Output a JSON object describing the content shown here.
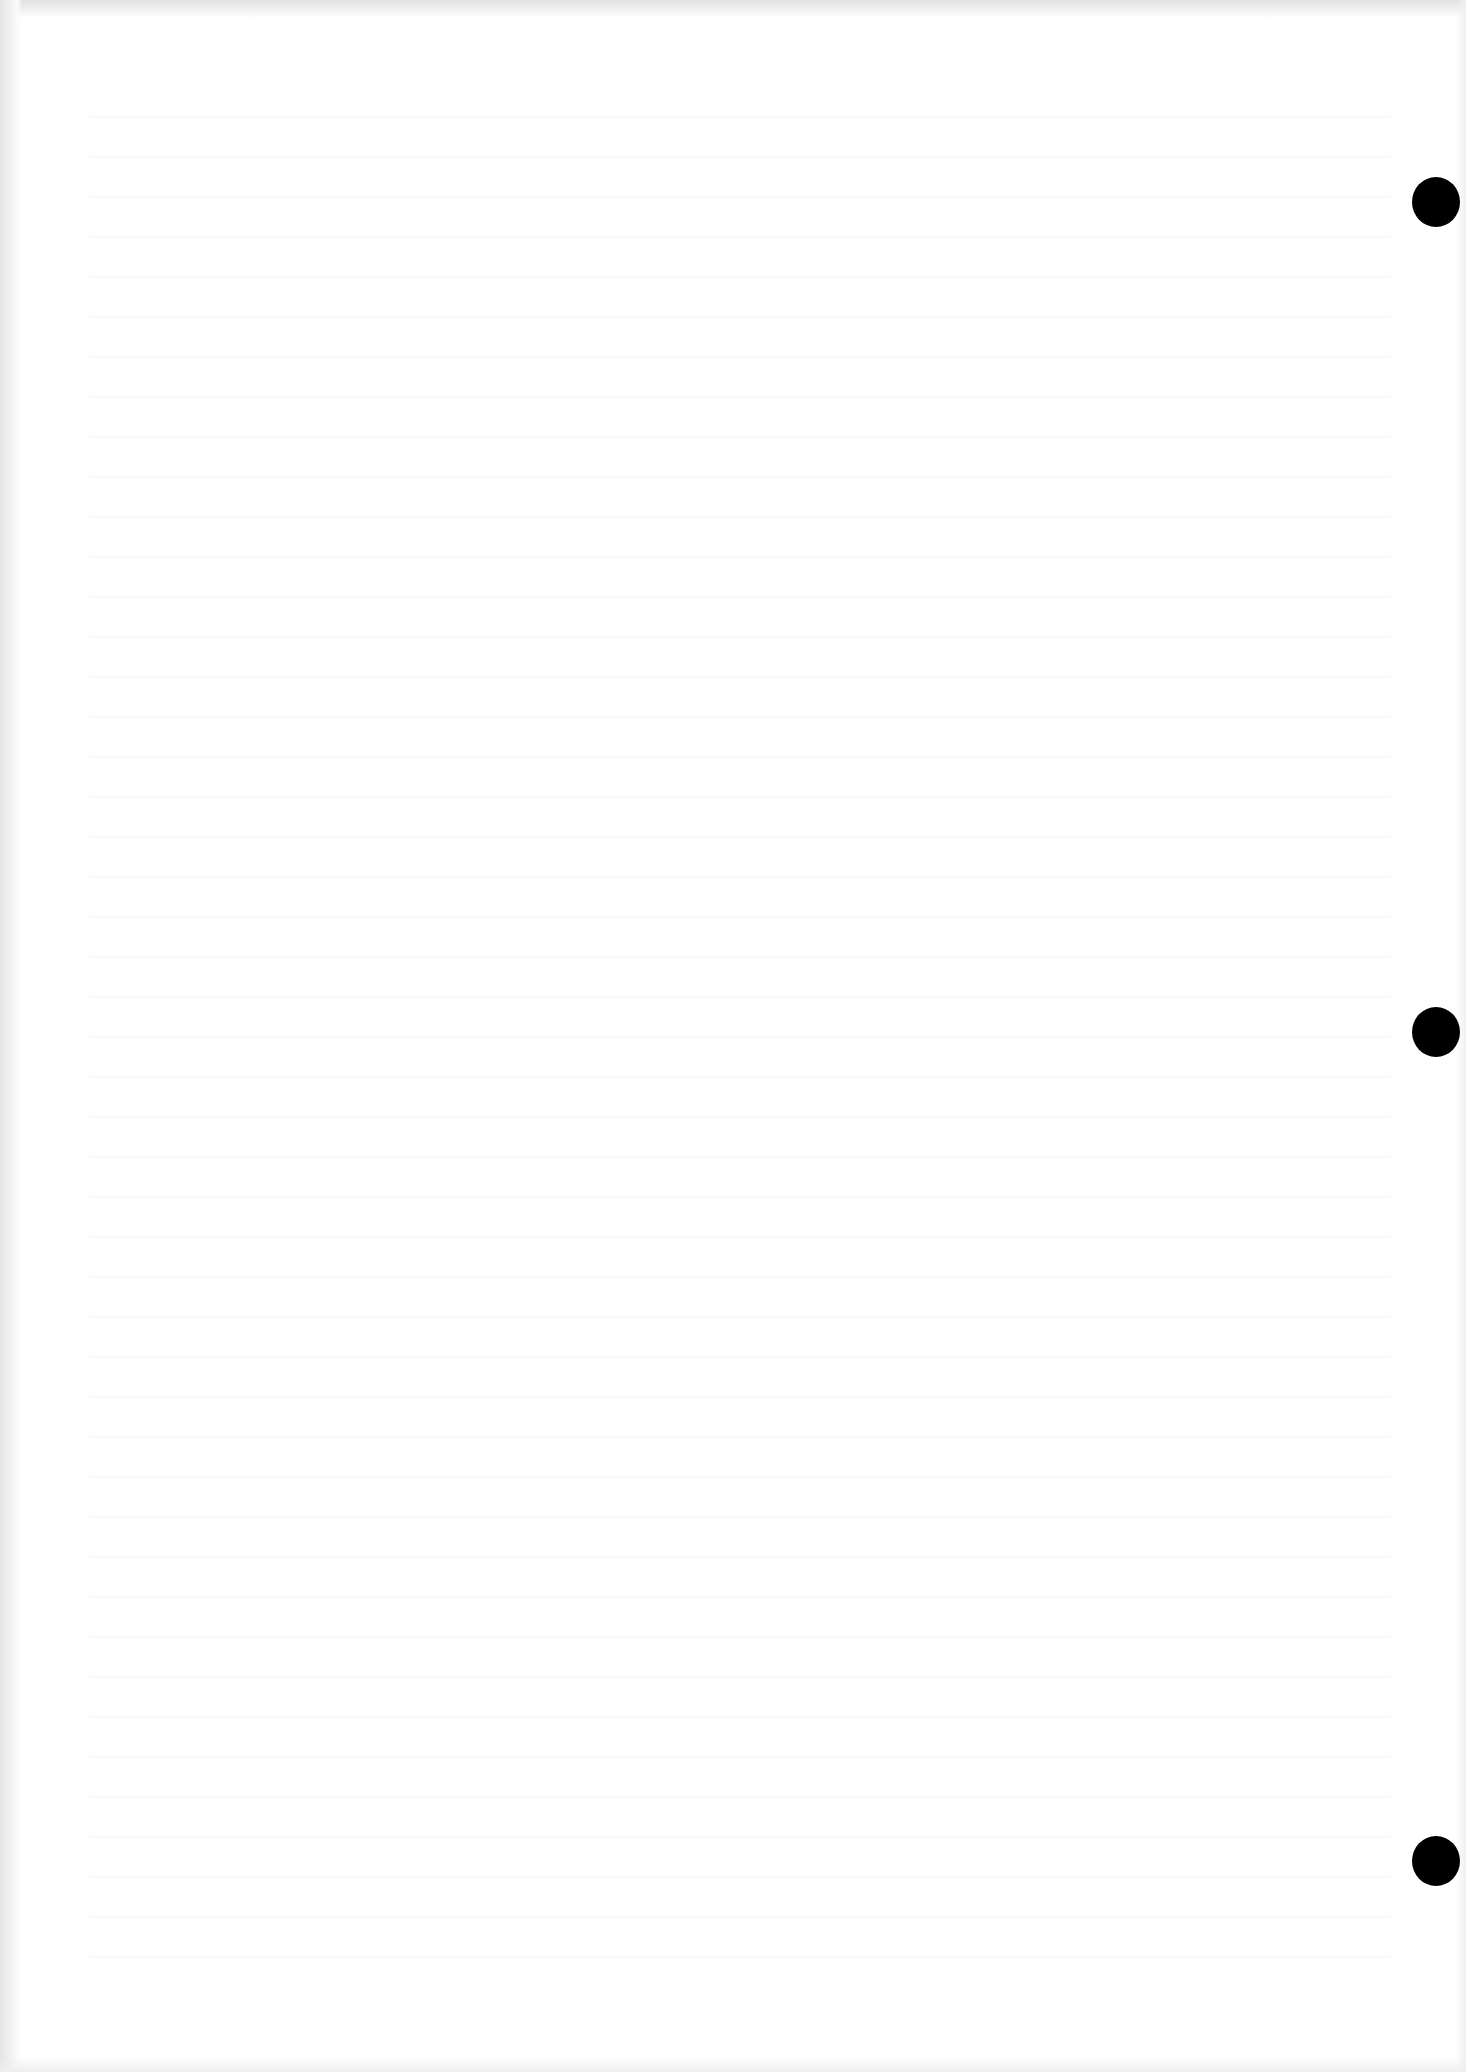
{
  "document": {
    "type": "scanned blank page",
    "background_color": "#ffffff",
    "visible_text": "",
    "punch_holes": [
      {
        "label": "top",
        "top": 177,
        "left": 1412,
        "color": "#000000"
      },
      {
        "label": "middle",
        "top": 1007,
        "left": 1412,
        "color": "#000000"
      },
      {
        "label": "bottom",
        "top": 1836,
        "left": 1412,
        "color": "#000000"
      }
    ]
  }
}
